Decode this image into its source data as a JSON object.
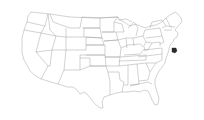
{
  "map": {
    "title": "United States map",
    "projection": "albers-usa-lower48",
    "base_fill": "#ffffff",
    "border_color": "#9a9a9a",
    "highlight_color": "#2b2b2b",
    "highlighted": [
      {
        "region": "Delaware",
        "callout": true
      }
    ]
  }
}
